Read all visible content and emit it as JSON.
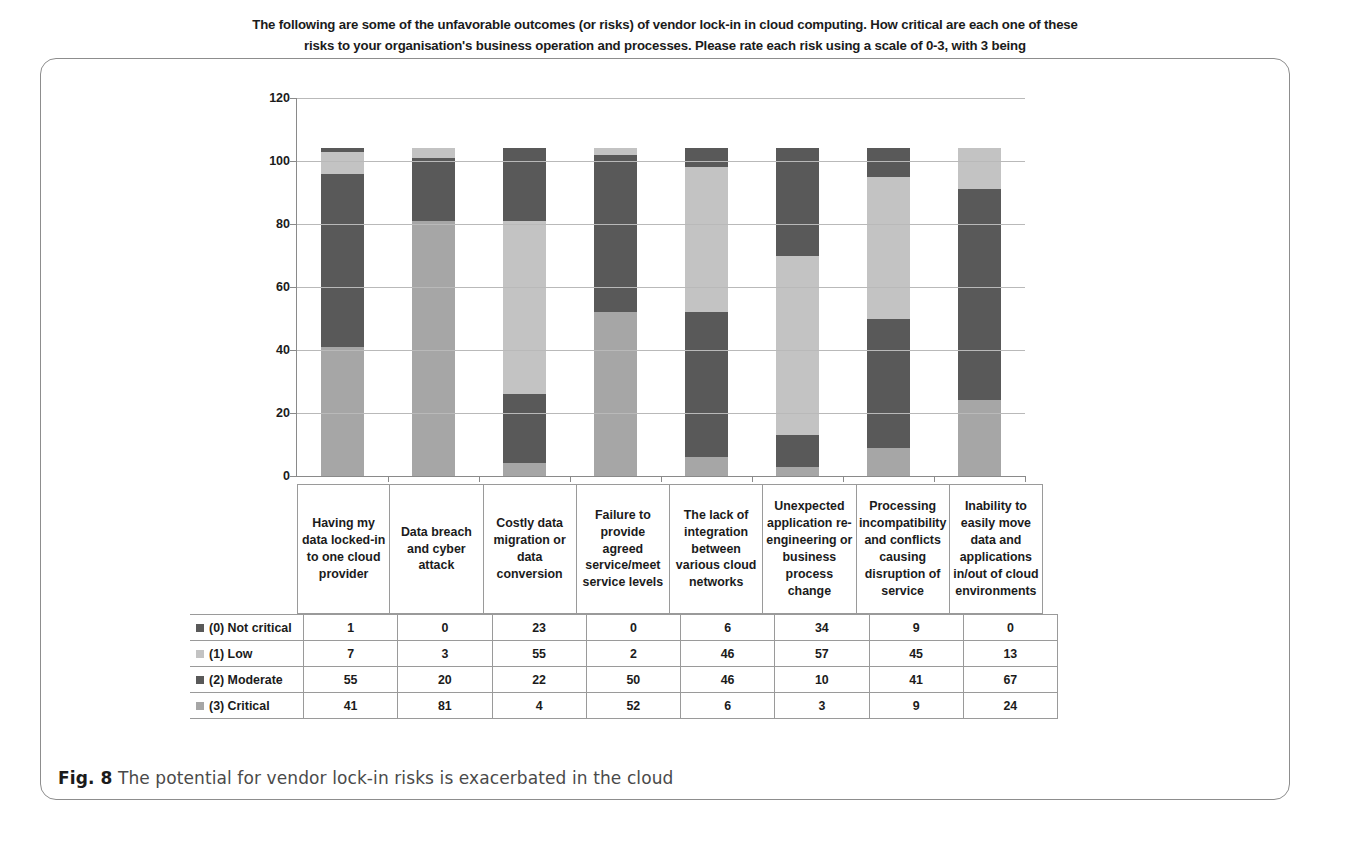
{
  "figure": {
    "caption_label": "Fig. 8",
    "caption_text": " The potential for vendor lock-in risks is exacerbated in the cloud"
  },
  "chart_data": {
    "type": "bar",
    "stacked": true,
    "title": "The following are some of the unfavorable outcomes (or risks) of vendor lock-in in cloud computing. How critical are each one of these risks to your organisation's business operation and processes. Please rate each risk using a scale of 0-3, with 3 being",
    "xlabel": "",
    "ylabel": "",
    "ylim": [
      0,
      120
    ],
    "yticks": [
      0,
      20,
      40,
      60,
      80,
      100,
      120
    ],
    "grid": true,
    "legend_position": "table-left",
    "categories": [
      "Having my data locked-in to one cloud provider",
      "Data breach and cyber attack",
      "Costly data migration or data conversion",
      "Failure to provide agreed service/meet service levels",
      "The lack of integration between various cloud networks",
      "Unexpected application re-engineering or business process change",
      "Processing incompatibility and conflicts causing disruption of service",
      "Inability to easily move data and applications in/out of cloud environments"
    ],
    "series": [
      {
        "name": "(0) Not critical",
        "color": "#595959",
        "stack_order": 4,
        "values": [
          1,
          0,
          23,
          0,
          6,
          34,
          9,
          0
        ]
      },
      {
        "name": "(1) Low",
        "color": "#c3c3c3",
        "stack_order": 3,
        "values": [
          7,
          3,
          55,
          2,
          46,
          57,
          45,
          13
        ]
      },
      {
        "name": "(2) Moderate",
        "color": "#595959",
        "stack_order": 2,
        "values": [
          55,
          20,
          22,
          50,
          46,
          10,
          41,
          67
        ]
      },
      {
        "name": "(3) Critical",
        "color": "#a6a6a6",
        "stack_order": 1,
        "values": [
          41,
          81,
          4,
          52,
          6,
          3,
          9,
          24
        ]
      }
    ]
  }
}
